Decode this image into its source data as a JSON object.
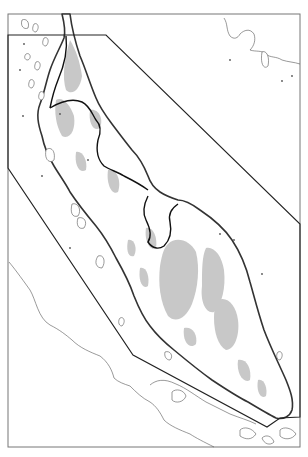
{
  "map": {
    "type": "outline-relief-map",
    "colors": {
      "background": "#ffffff",
      "relief_highlands": "#c8c8c8",
      "coastline": "#333333",
      "borders": "#111111",
      "study_area_polygon": "#222222",
      "frame": "#777777"
    },
    "frame": {
      "x": 8,
      "y": 14,
      "width": 292,
      "height": 433
    },
    "study_area_polygon": [
      [
        8,
        35
      ],
      [
        106,
        35
      ],
      [
        300,
        224
      ],
      [
        300,
        417
      ],
      [
        280,
        418
      ],
      [
        267,
        427
      ],
      [
        133,
        355
      ],
      [
        8,
        168
      ]
    ],
    "labels": []
  }
}
